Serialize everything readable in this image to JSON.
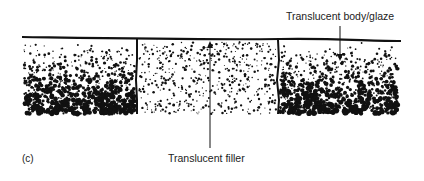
{
  "figure": {
    "panel_label": "(c)",
    "annotations": [
      {
        "id": "glaze",
        "text": "Translucent body/glaze",
        "arrow_to": [
          340,
          60
        ],
        "arrow_from": [
          340,
          26
        ]
      },
      {
        "id": "filler",
        "text": "Translucent filler",
        "arrow_to": [
          210,
          42
        ],
        "arrow_from": [
          210,
          148
        ]
      }
    ],
    "regions": [
      {
        "name": "left-body",
        "x": [
          22,
          137
        ],
        "density": "dense-bottom"
      },
      {
        "name": "center-filler",
        "x": [
          137,
          278
        ],
        "density": "light"
      },
      {
        "name": "right-body",
        "x": [
          278,
          400
        ],
        "density": "dense-bottom"
      }
    ],
    "colors": {
      "ink": "#111111",
      "background": "#ffffff"
    }
  }
}
